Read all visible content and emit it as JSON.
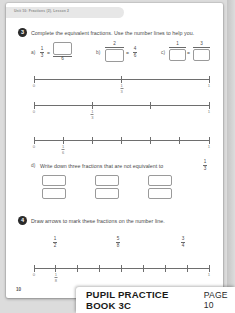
{
  "running_head": "Unit 10: Fractions (2), Lesson 2",
  "page_number": "10",
  "footer": {
    "book_title": "PUPIL PRACTICE BOOK 3C",
    "page_label": "PAGE 10"
  },
  "questions": [
    {
      "number": "3",
      "prompt": "Complete the equivalent fractions. Use the number lines to help you.",
      "parts": [
        {
          "label": "a)",
          "left": {
            "numerator": "1",
            "denominator": "3"
          },
          "equals": "=",
          "right": {
            "numerator": "",
            "denominator": "6",
            "numerator_is_box": true
          }
        },
        {
          "label": "b)",
          "left": {
            "numerator": "2",
            "denominator": "",
            "denominator_is_box": true
          },
          "equals": "=",
          "right": {
            "numerator": "4",
            "denominator": "6"
          }
        },
        {
          "label": "c)",
          "left": {
            "numerator": "1",
            "denominator": "",
            "denominator_is_box": true
          },
          "equals": "=",
          "right": {
            "numerator": "3",
            "denominator": "",
            "denominator_is_box": true
          }
        }
      ],
      "number_lines": [
        {
          "name": "thirds-halfway",
          "ticks": 3,
          "labels": [
            {
              "index": 0,
              "whole": "0"
            },
            {
              "index": 1,
              "numerator": "1",
              "denominator": "3"
            },
            {
              "index": 2,
              "whole": "1"
            }
          ]
        },
        {
          "name": "thirds",
          "ticks": 4,
          "labels": [
            {
              "index": 0,
              "whole": "0"
            },
            {
              "index": 1,
              "numerator": "1",
              "denominator": "3"
            },
            {
              "index": 3,
              "whole": "1"
            }
          ]
        },
        {
          "name": "sixths",
          "ticks": 7,
          "labels": [
            {
              "index": 0,
              "whole": "0"
            },
            {
              "index": 1,
              "numerator": "1",
              "denominator": "6"
            },
            {
              "index": 6,
              "whole": "1"
            }
          ]
        }
      ],
      "part_d": {
        "label": "d)",
        "prompt_before": "Write down three fractions that are not equivalent to",
        "fraction": {
          "numerator": "1",
          "denominator": "3"
        },
        "prompt_after": ".",
        "answer_boxes": 3
      }
    },
    {
      "number": "4",
      "prompt": "Draw arrows to mark these fractions on the number line.",
      "fractions": [
        {
          "numerator": "1",
          "denominator": "2"
        },
        {
          "numerator": "5",
          "denominator": "8"
        },
        {
          "numerator": "3",
          "denominator": "4"
        }
      ],
      "number_lines": [
        {
          "name": "eighths",
          "ticks": 9,
          "labels": [
            {
              "index": 0,
              "whole": "0"
            },
            {
              "index": 1,
              "numerator": "1",
              "denominator": "8"
            },
            {
              "index": 8,
              "whole": "1"
            }
          ]
        }
      ]
    }
  ],
  "colors": {
    "page": "#ffffff",
    "backdrop": "#dcdcdc",
    "ink": "#4a4a4a",
    "rule": "#6e6e6e",
    "box_border": "#9a9a9a",
    "bullet": "#2b2b2b"
  }
}
